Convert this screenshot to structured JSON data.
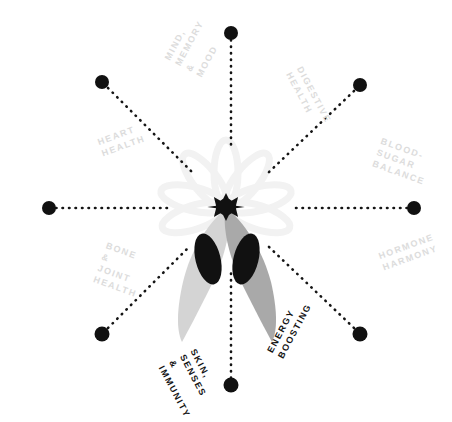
{
  "figure": {
    "type": "radial-spoke-diagram",
    "title": "",
    "background_color": "#ffffff",
    "center": {
      "x": 226,
      "y": 207
    },
    "center_motif": {
      "name": "star-anise-flower",
      "hub_icon": "starburst-icon",
      "hub_color": "#111111",
      "petal_color": "#f3f3f3",
      "pod_left_color": "#d4d4d4",
      "pod_right_color": "#a9a9a9",
      "seed_color": "#111111"
    },
    "dot_color": "#111111",
    "connector_style": "dotted",
    "spokes": [
      {
        "id": "mind-memory-mood",
        "label": "MIND,\nMEMORY\n& MOOD",
        "emphasis": "faint",
        "color": "#dcdcdc",
        "angle_deg": -60,
        "node": {
          "x": 102,
          "y": 82
        },
        "label_pos": {
          "x": 183,
          "y": 68
        },
        "label_rotation_deg": -62
      },
      {
        "id": "digestive-health",
        "label": "DIGESTIVE\nHEALTH",
        "emphasis": "faint",
        "color": "#dcdcdc",
        "angle_deg": -120,
        "node": {
          "x": 360,
          "y": 85
        },
        "label_pos": {
          "x": 294,
          "y": 70
        },
        "label_rotation_deg": 62
      },
      {
        "id": "heart-health",
        "label": "HEART\nHEALTH",
        "emphasis": "faint",
        "color": "#dcdcdc",
        "angle_deg": 180,
        "node": {
          "x": 49,
          "y": 208
        },
        "label_pos": {
          "x": 100,
          "y": 148
        },
        "label_rotation_deg": -20
      },
      {
        "id": "blood-sugar-balance",
        "label": "BLOOD-\nSUGAR\nBALANCE",
        "emphasis": "faint",
        "color": "#dcdcdc",
        "angle_deg": 0,
        "node": {
          "x": 414,
          "y": 208
        },
        "label_pos": {
          "x": 377,
          "y": 152
        },
        "label_rotation_deg": 20
      },
      {
        "id": "bone-joint-health",
        "label": "BONE &\nJOINT\nHEALTH",
        "emphasis": "faint",
        "color": "#dcdcdc",
        "angle_deg": 120,
        "node": {
          "x": 102,
          "y": 334
        },
        "label_pos": {
          "x": 100,
          "y": 262
        },
        "label_rotation_deg": 20
      },
      {
        "id": "hormone-harmony",
        "label": "HORMONE\nHARMONY",
        "emphasis": "faint",
        "color": "#dcdcdc",
        "angle_deg": 60,
        "node": {
          "x": 360,
          "y": 334
        },
        "label_pos": {
          "x": 381,
          "y": 262
        },
        "label_rotation_deg": -20
      },
      {
        "id": "skin-senses-immunity",
        "label": "SKIN,\nSENSES &\nIMMUNITY",
        "emphasis": "dark",
        "color": "#141414",
        "angle_deg": 90,
        "node": {
          "x": 231,
          "y": 385
        },
        "label_pos": {
          "x": 177,
          "y": 358
        },
        "label_rotation_deg": 62
      },
      {
        "id": "energy-boosting",
        "label": "ENERGY\nBOOSTING",
        "emphasis": "dark",
        "color": "#141414",
        "angle_deg": 90,
        "node": {
          "x": 231,
          "y": 385
        },
        "label_pos": {
          "x": 275,
          "y": 355
        },
        "label_rotation_deg": -62
      }
    ],
    "nodes_count": 8,
    "top_node": {
      "x": 231,
      "y": 33
    },
    "bottom_node": {
      "x": 231,
      "y": 385
    }
  }
}
